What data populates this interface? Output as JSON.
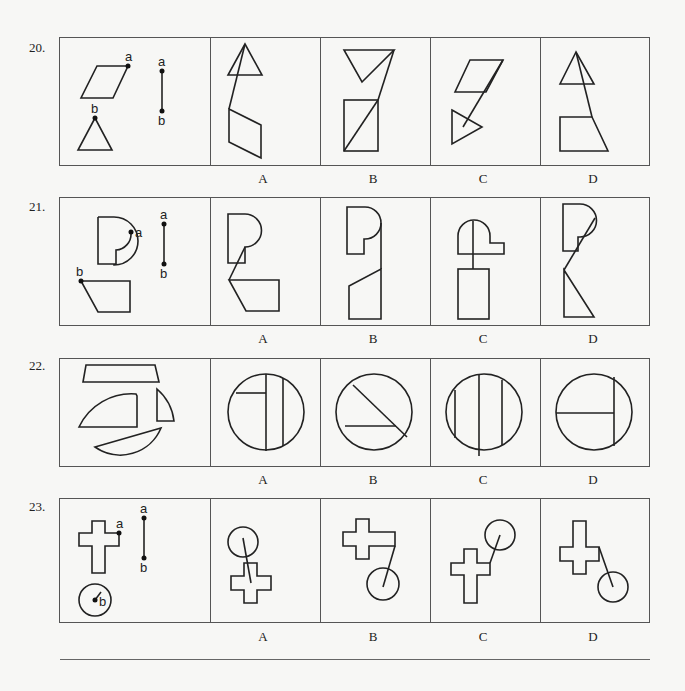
{
  "questions": [
    {
      "number": "20.",
      "options": [
        "A",
        "B",
        "C",
        "D"
      ],
      "stem_labels": {
        "a": "a",
        "b": "b"
      }
    },
    {
      "number": "21.",
      "options": [
        "A",
        "B",
        "C",
        "D"
      ],
      "stem_labels": {
        "a": "a",
        "b": "b"
      }
    },
    {
      "number": "22.",
      "options": [
        "A",
        "B",
        "C",
        "D"
      ]
    },
    {
      "number": "23.",
      "options": [
        "A",
        "B",
        "C",
        "D"
      ],
      "stem_labels": {
        "a": "a",
        "b": "b"
      }
    }
  ]
}
